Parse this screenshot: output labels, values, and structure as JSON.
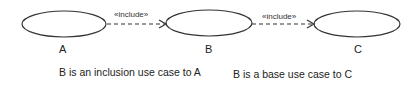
{
  "diagram": {
    "use_cases": [
      {
        "id": "A",
        "label": "A"
      },
      {
        "id": "B",
        "label": "B"
      },
      {
        "id": "C",
        "label": "C"
      }
    ],
    "relations": [
      {
        "from": "A",
        "to": "B",
        "stereotype": "«include»",
        "style": "dashed-arrow"
      },
      {
        "from": "B",
        "to": "C",
        "stereotype": "«include»",
        "style": "dashed-arrow"
      }
    ],
    "captions": [
      "B is an inclusion use case to A",
      "B is a base use case to C"
    ],
    "colors": {
      "line": "#333333",
      "background": "#ffffff",
      "text": "#222222"
    }
  }
}
